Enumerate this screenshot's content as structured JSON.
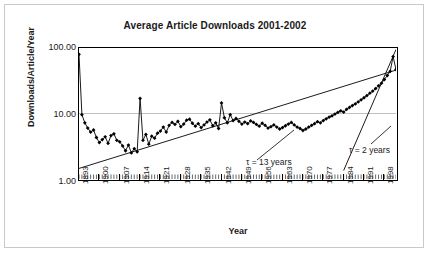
{
  "chart_data": {
    "type": "line",
    "title": "Average Article Downloads 2001-2002",
    "xlabel": "Year",
    "ylabel": "Downloads/Article/Year",
    "yscale": "log",
    "ylim": [
      1.0,
      100.0
    ],
    "xlim": [
      1893,
      2002
    ],
    "grid": true,
    "legend": null,
    "ytick_labels": [
      "100.00",
      "10.00",
      "1.00"
    ],
    "ytick_values": [
      100.0,
      10.0,
      1.0
    ],
    "xtick_labels": [
      "1893",
      "1900",
      "1907",
      "1914",
      "1921",
      "1928",
      "1935",
      "1942",
      "1949",
      "1956",
      "1963",
      "1970",
      "1977",
      "1984",
      "1991",
      "1998"
    ],
    "xtick_values": [
      1893,
      1900,
      1907,
      1914,
      1921,
      1928,
      1935,
      1942,
      1949,
      1956,
      1963,
      1970,
      1977,
      1984,
      1991,
      1998
    ],
    "annotations": [
      {
        "text": "τ = 13 years",
        "x": 1963,
        "y": 2.3
      },
      {
        "text": "τ = 2 years",
        "x": 1989,
        "y": 3.3
      }
    ],
    "trendlines": [
      {
        "name": "tau-13-years",
        "x": [
          1893,
          2002
        ],
        "y": [
          1.45,
          46.0
        ]
      },
      {
        "name": "tau-2-years",
        "x": [
          1984,
          2002
        ],
        "y": [
          1.35,
          95.0
        ]
      }
    ],
    "marker": "diamond",
    "series": [
      {
        "name": "Average downloads per article per year",
        "x": [
          1893,
          1894,
          1895,
          1896,
          1897,
          1898,
          1899,
          1900,
          1901,
          1902,
          1903,
          1904,
          1905,
          1906,
          1907,
          1908,
          1909,
          1910,
          1911,
          1912,
          1913,
          1914,
          1915,
          1916,
          1917,
          1918,
          1919,
          1920,
          1921,
          1922,
          1923,
          1924,
          1925,
          1926,
          1927,
          1928,
          1929,
          1930,
          1931,
          1932,
          1933,
          1934,
          1935,
          1936,
          1937,
          1938,
          1939,
          1940,
          1941,
          1942,
          1943,
          1944,
          1945,
          1946,
          1947,
          1948,
          1949,
          1950,
          1951,
          1952,
          1953,
          1954,
          1955,
          1956,
          1957,
          1958,
          1959,
          1960,
          1961,
          1962,
          1963,
          1964,
          1965,
          1966,
          1967,
          1968,
          1969,
          1970,
          1971,
          1972,
          1973,
          1974,
          1975,
          1976,
          1977,
          1978,
          1979,
          1980,
          1981,
          1982,
          1983,
          1984,
          1985,
          1986,
          1987,
          1988,
          1989,
          1990,
          1991,
          1992,
          1993,
          1994,
          1995,
          1996,
          1997,
          1998,
          1999,
          2000,
          2001,
          2002
        ],
        "y": [
          80.0,
          9.6,
          7.2,
          6.0,
          5.2,
          5.6,
          4.3,
          3.6,
          4.0,
          4.4,
          3.5,
          4.6,
          4.9,
          3.9,
          3.7,
          3.2,
          2.7,
          3.3,
          2.5,
          2.9,
          2.6,
          17.0,
          3.9,
          4.8,
          3.4,
          4.5,
          4.2,
          5.0,
          5.4,
          6.2,
          5.2,
          6.6,
          7.3,
          6.8,
          7.6,
          6.3,
          6.9,
          7.9,
          8.2,
          7.1,
          6.4,
          7.0,
          6.1,
          6.7,
          7.4,
          8.0,
          6.5,
          7.2,
          5.9,
          14.5,
          8.6,
          7.2,
          9.6,
          7.8,
          8.4,
          7.6,
          6.9,
          7.4,
          7.0,
          7.7,
          7.3,
          6.8,
          6.4,
          7.1,
          6.6,
          6.0,
          6.3,
          6.7,
          6.2,
          5.8,
          6.1,
          6.5,
          6.9,
          7.3,
          6.7,
          6.2,
          5.9,
          5.5,
          5.8,
          6.2,
          6.6,
          7.0,
          7.5,
          7.2,
          7.8,
          8.3,
          8.8,
          9.2,
          9.8,
          10.4,
          11.0,
          10.5,
          11.6,
          12.4,
          13.2,
          14.0,
          15.0,
          16.2,
          17.4,
          18.8,
          20.4,
          22.0,
          24.0,
          26.5,
          29.0,
          33.0,
          38.0,
          44.0,
          74.0,
          47.0
        ]
      }
    ]
  }
}
